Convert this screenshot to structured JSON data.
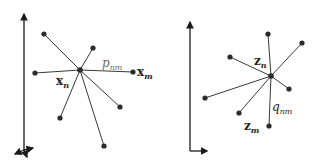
{
  "left_panel": {
    "name": "input-space",
    "center": [
      80,
      70
    ],
    "neighbors": [
      [
        44,
        34
      ],
      [
        93,
        48
      ],
      [
        35,
        73
      ],
      [
        133,
        72
      ],
      [
        120,
        107
      ],
      [
        60,
        118
      ],
      [
        104,
        146
      ]
    ],
    "labels": {
      "similarity": {
        "base": "p",
        "sub": "nm"
      },
      "neighbor_point": {
        "base": "x",
        "sub": "m"
      },
      "center_point": {
        "base": "x",
        "sub": "n"
      }
    }
  },
  "right_panel": {
    "name": "embedding-space",
    "center": [
      271,
      76
    ],
    "neighbors": [
      [
        268,
        34
      ],
      [
        302,
        43
      ],
      [
        230,
        57
      ],
      [
        289,
        89
      ],
      [
        205,
        98
      ],
      [
        239,
        113
      ],
      [
        269,
        126
      ]
    ],
    "labels": {
      "center_point": {
        "base": "z",
        "sub": "n"
      },
      "similarity": {
        "base": "q",
        "sub": "nm"
      },
      "neighbor_point": {
        "base": "z",
        "sub": "m"
      }
    }
  }
}
